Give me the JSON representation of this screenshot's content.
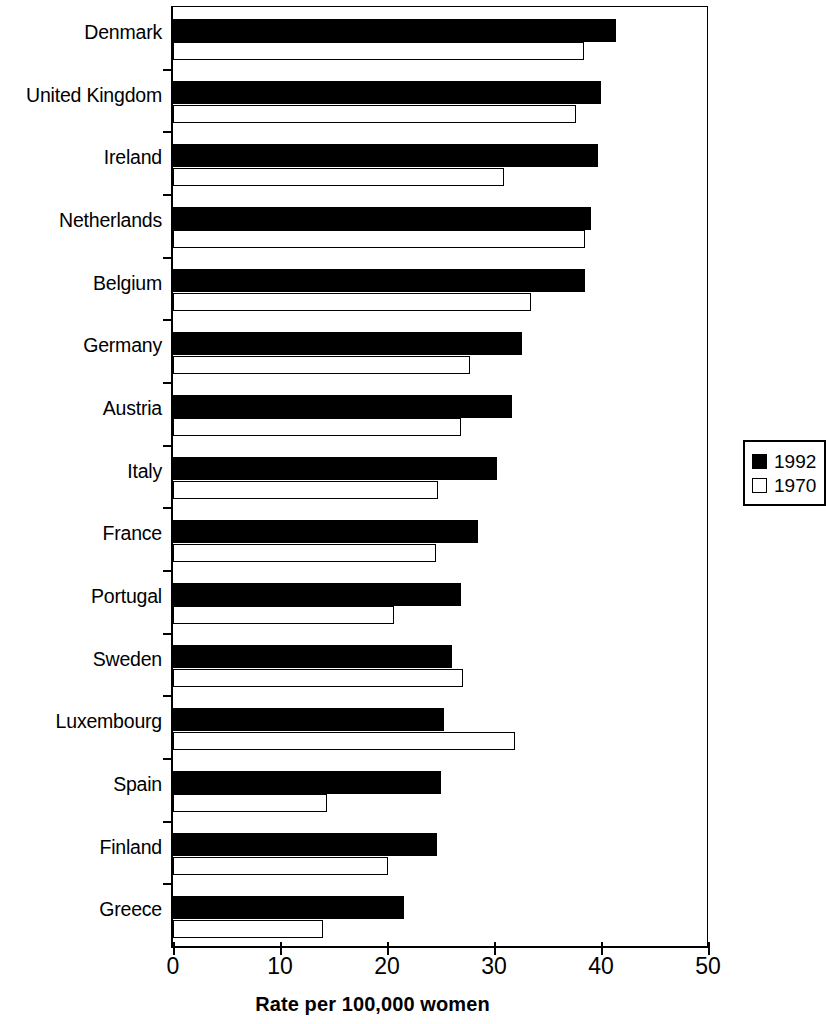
{
  "chart_data": {
    "type": "bar",
    "orientation": "horizontal",
    "title": "",
    "xlabel": "Rate per 100,000 women",
    "ylabel": "",
    "xlim": [
      0,
      50
    ],
    "xticks": [
      0,
      10,
      20,
      30,
      40,
      50
    ],
    "xtick_labels": [
      "0",
      "10",
      "20",
      "30",
      "40",
      "50"
    ],
    "grid": false,
    "legend_position": "right",
    "categories": [
      "Denmark",
      "United Kingdom",
      "Ireland",
      "Netherlands",
      "Belgium",
      "Germany",
      "Austria",
      "Italy",
      "France",
      "Portugal",
      "Sweden",
      "Luxembourg",
      "Spain",
      "Finland",
      "Greece"
    ],
    "series": [
      {
        "name": "1992",
        "style": "filled-black",
        "color": "#000000",
        "values": [
          41.4,
          40.0,
          39.7,
          39.1,
          38.5,
          32.6,
          31.7,
          30.3,
          28.5,
          26.9,
          26.1,
          25.3,
          25.0,
          24.7,
          21.6
        ]
      },
      {
        "name": "1970",
        "style": "open-white",
        "color": "#ffffff",
        "values": [
          38.4,
          37.7,
          30.9,
          38.5,
          33.5,
          27.8,
          26.9,
          24.8,
          24.6,
          20.7,
          27.1,
          32.0,
          14.4,
          20.1,
          14.0
        ]
      }
    ]
  },
  "legend": {
    "entries": [
      {
        "label": "1992",
        "swatch": "filled"
      },
      {
        "label": "1970",
        "swatch": "open"
      }
    ]
  },
  "axis": {
    "x_title": "Rate per 100,000 women"
  }
}
